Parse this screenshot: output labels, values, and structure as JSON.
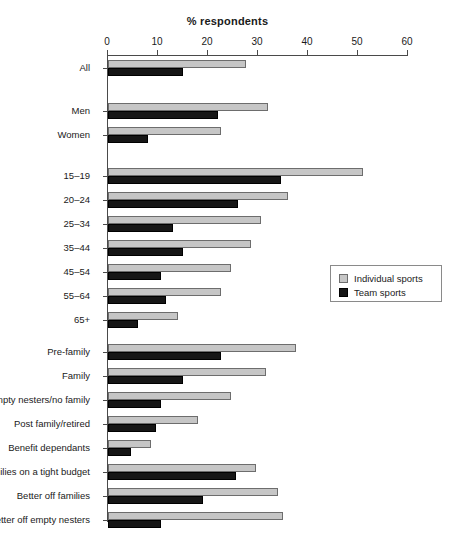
{
  "chart": {
    "title": "% respondents",
    "legend": {
      "position": "right-middle",
      "entries": [
        {
          "label": "Individual sports",
          "icon": "square-swatch",
          "color": "#c6c6c6"
        },
        {
          "label": "Team sports",
          "icon": "square-swatch",
          "color": "#161616"
        }
      ]
    }
  },
  "chart_data": {
    "type": "bar",
    "orientation": "horizontal",
    "title": "% respondents",
    "xlabel": "% respondents",
    "ylabel": "",
    "xlim": [
      0,
      60
    ],
    "xticks": [
      0,
      10,
      20,
      30,
      40,
      50,
      60
    ],
    "xtick_labels": [
      "0",
      "10",
      "20",
      "30",
      "40",
      "50",
      "60"
    ],
    "grid": false,
    "legend_position": "right",
    "categories": [
      "All",
      "Men",
      "Women",
      "15–19",
      "20–24",
      "25–34",
      "35–44",
      "45–54",
      "55–64",
      "65+",
      "Pre-family",
      "Family",
      "Empty nesters/no family",
      "Post family/retired",
      "Benefit dependants",
      "Families on a tight budget",
      "Better off families",
      "Better off empty nesters"
    ],
    "series": [
      {
        "name": "Individual sports",
        "color": "#c6c6c6",
        "values": [
          27.5,
          32.0,
          22.5,
          51.0,
          36.0,
          30.5,
          28.5,
          24.5,
          22.5,
          14.0,
          37.5,
          31.5,
          24.5,
          18.0,
          8.5,
          29.5,
          34.0,
          35.0
        ]
      },
      {
        "name": "Team sports",
        "color": "#161616",
        "values": [
          15.0,
          22.0,
          8.0,
          34.5,
          26.0,
          13.0,
          15.0,
          10.5,
          11.5,
          6.0,
          22.5,
          15.0,
          10.5,
          9.5,
          4.5,
          25.5,
          19.0,
          10.5
        ]
      }
    ],
    "group_blocks": [
      {
        "name": "overall",
        "categories": [
          "All"
        ]
      },
      {
        "name": "gender",
        "categories": [
          "Men",
          "Women"
        ]
      },
      {
        "name": "age",
        "categories": [
          "15–19",
          "20–24",
          "25–34",
          "35–44",
          "45–54",
          "55–64",
          "65+"
        ]
      },
      {
        "name": "lifestage",
        "categories": [
          "Pre-family",
          "Family",
          "Empty nesters/no family",
          "Post family/retired",
          "Benefit dependants",
          "Families on a tight budget",
          "Better off families",
          "Better off empty nesters"
        ]
      }
    ]
  }
}
